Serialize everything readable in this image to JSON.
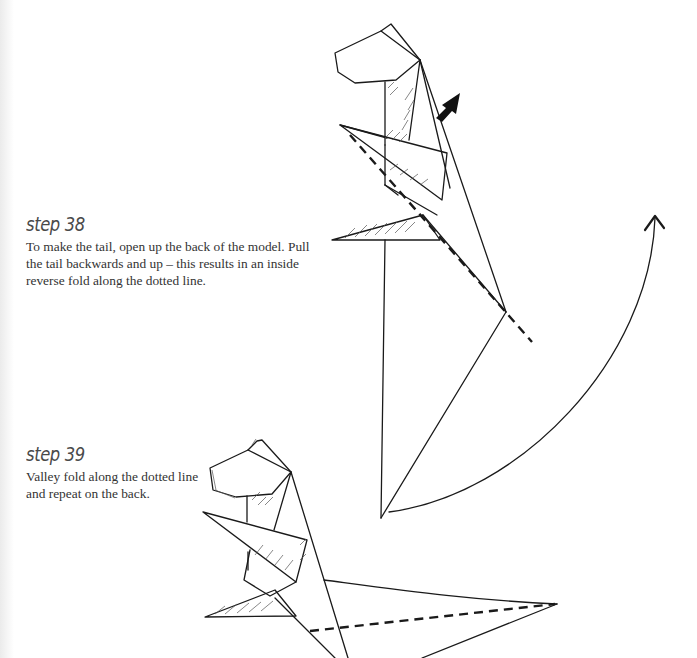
{
  "steps": [
    {
      "heading": "step 38",
      "text": "To make the tail, open up the back of the model. Pull the tail backwards and up – this results in an inside reverse fold along the dotted line."
    },
    {
      "heading": "step 39",
      "text": "Valley fold along the dotted line and repeat on the back."
    }
  ],
  "diagrams": [
    {
      "name": "step-38-diagram",
      "symbols": [
        "push-arrow-icon",
        "curved-arrow-icon",
        "dashed-fold-line"
      ]
    },
    {
      "name": "step-39-diagram",
      "symbols": [
        "dashed-fold-line"
      ]
    }
  ],
  "colors": {
    "ink": "#1a1a1a",
    "heading": "#4a4a4a",
    "body_text": "#333333",
    "page": "#ffffff"
  }
}
